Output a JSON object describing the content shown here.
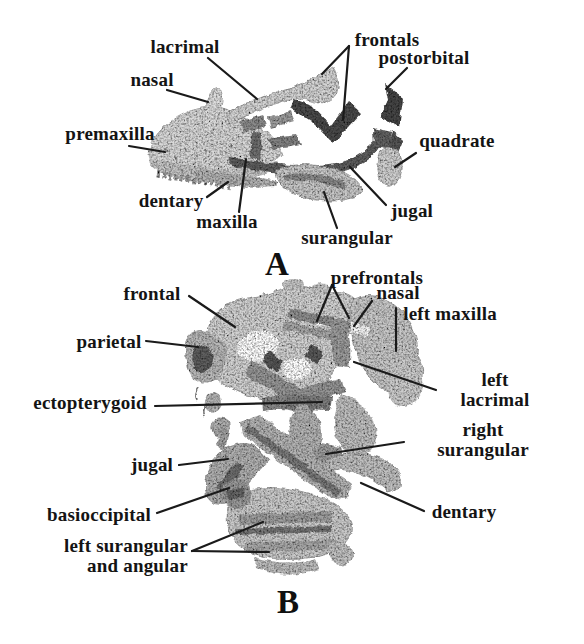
{
  "figure": {
    "type": "anatomical-specimen-figure",
    "background_color": "#ffffff",
    "text_color": "#141414",
    "line_color": "#1a1a1a",
    "bone_light_color": "#d6d6d6",
    "bone_dark_color": "#4c4c4c",
    "panels": [
      {
        "panel_letter": "A",
        "letter_pos": {
          "x": 277,
          "y": 264
        },
        "labels": [
          {
            "text": "lacrimal",
            "x": 185,
            "y": 47
          },
          {
            "text": "nasal",
            "x": 152,
            "y": 80
          },
          {
            "text": "premaxilla",
            "x": 110,
            "y": 134
          },
          {
            "text": "dentary",
            "x": 171,
            "y": 201
          },
          {
            "text": "maxilla",
            "x": 227,
            "y": 222
          },
          {
            "text": "frontals",
            "x": 387,
            "y": 40
          },
          {
            "text": "postorbital",
            "x": 424,
            "y": 58
          },
          {
            "text": "quadrate",
            "x": 457,
            "y": 141
          },
          {
            "text": "jugal",
            "x": 412,
            "y": 211
          },
          {
            "text": "surangular",
            "x": 347,
            "y": 238
          }
        ],
        "leader_lines": [
          {
            "x1": 208,
            "y1": 58,
            "x2": 257,
            "y2": 99
          },
          {
            "x1": 167,
            "y1": 90,
            "x2": 208,
            "y2": 102
          },
          {
            "x1": 129,
            "y1": 146,
            "x2": 165,
            "y2": 152
          },
          {
            "x1": 207,
            "y1": 197,
            "x2": 228,
            "y2": 182
          },
          {
            "x1": 239,
            "y1": 212,
            "x2": 246,
            "y2": 159
          },
          {
            "x1": 349,
            "y1": 46,
            "x2": 322,
            "y2": 74
          },
          {
            "x1": 349,
            "y1": 46,
            "x2": 343,
            "y2": 120
          },
          {
            "x1": 407,
            "y1": 68,
            "x2": 386,
            "y2": 89
          },
          {
            "x1": 416,
            "y1": 153,
            "x2": 395,
            "y2": 167
          },
          {
            "x1": 386,
            "y1": 205,
            "x2": 350,
            "y2": 167
          },
          {
            "x1": 337,
            "y1": 228,
            "x2": 324,
            "y2": 192
          }
        ]
      },
      {
        "panel_letter": "B",
        "letter_pos": {
          "x": 288,
          "y": 602
        },
        "labels": [
          {
            "text": "frontal",
            "x": 152,
            "y": 294
          },
          {
            "text": "parietal",
            "x": 109,
            "y": 342
          },
          {
            "text": "ectopterygoid",
            "x": 90,
            "y": 403
          },
          {
            "text": "jugal",
            "x": 152,
            "y": 465
          },
          {
            "text": "basioccipital",
            "x": 99,
            "y": 515
          },
          {
            "text": "left surangular\nand angular",
            "x": 126,
            "y": 556
          },
          {
            "text": "prefrontals",
            "x": 377,
            "y": 278
          },
          {
            "text": "nasal",
            "x": 398,
            "y": 293
          },
          {
            "text": "left maxilla",
            "x": 450,
            "y": 314
          },
          {
            "text": "left lacrimal",
            "x": 495,
            "y": 390
          },
          {
            "text": "right surangular",
            "x": 483,
            "y": 440
          },
          {
            "text": "dentary",
            "x": 464,
            "y": 512
          }
        ],
        "leader_lines": [
          {
            "x1": 189,
            "y1": 296,
            "x2": 235,
            "y2": 327
          },
          {
            "x1": 146,
            "y1": 341,
            "x2": 198,
            "y2": 347
          },
          {
            "x1": 155,
            "y1": 406,
            "x2": 322,
            "y2": 402
          },
          {
            "x1": 179,
            "y1": 465,
            "x2": 228,
            "y2": 459
          },
          {
            "x1": 157,
            "y1": 513,
            "x2": 229,
            "y2": 488
          },
          {
            "x1": 192,
            "y1": 551,
            "x2": 263,
            "y2": 522
          },
          {
            "x1": 192,
            "y1": 551,
            "x2": 269,
            "y2": 552
          },
          {
            "x1": 332,
            "y1": 285,
            "x2": 317,
            "y2": 321
          },
          {
            "x1": 332,
            "y1": 285,
            "x2": 349,
            "y2": 318
          },
          {
            "x1": 372,
            "y1": 301,
            "x2": 354,
            "y2": 326
          },
          {
            "x1": 396,
            "y1": 308,
            "x2": 396,
            "y2": 351
          },
          {
            "x1": 436,
            "y1": 390,
            "x2": 354,
            "y2": 362
          },
          {
            "x1": 404,
            "y1": 442,
            "x2": 326,
            "y2": 454
          },
          {
            "x1": 424,
            "y1": 511,
            "x2": 361,
            "y2": 483
          }
        ]
      }
    ]
  }
}
